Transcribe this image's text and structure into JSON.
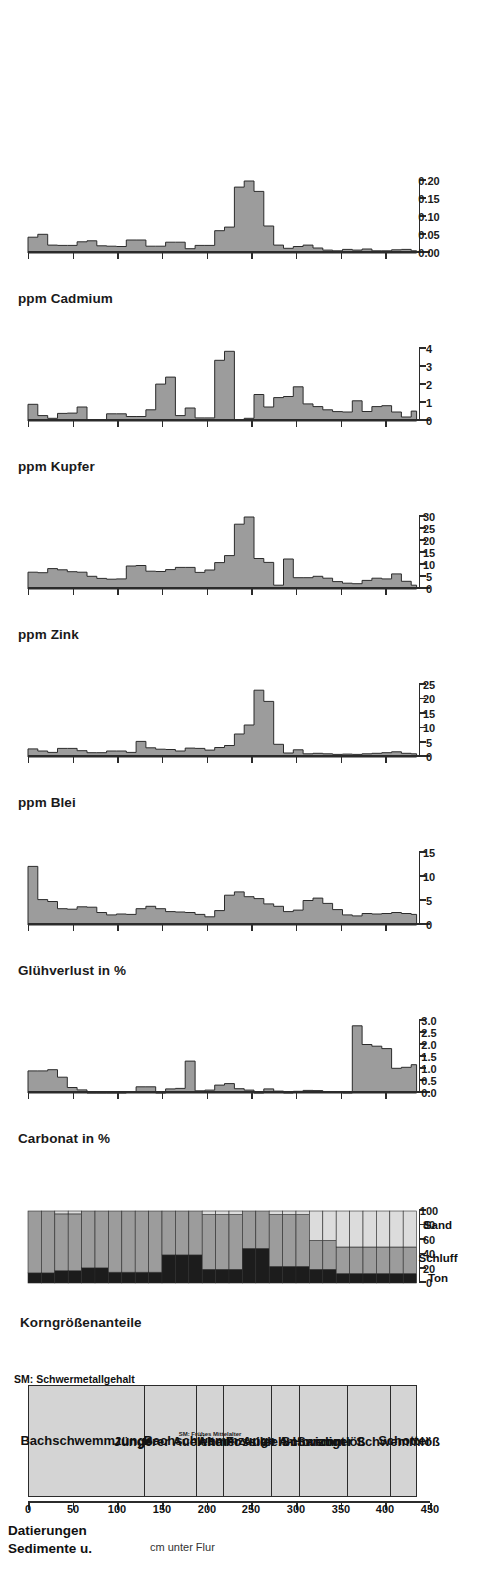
{
  "figure": {
    "orientation": "rotated-90",
    "depth_axis": {
      "label": "cm unter Flur",
      "ticks": [
        0,
        50,
        100,
        150,
        200,
        250,
        300,
        350,
        400,
        450
      ],
      "min": 0,
      "max": 450
    },
    "colors": {
      "bar_fill": "#9c9c9c",
      "bar_stroke": "#2b2b2b",
      "ton": "#1c1c1c",
      "schluff": "#9c9c9c",
      "sand": "#dcdcdc",
      "sediment_fill": "#d4d4d4",
      "axis": "#2b2b2b"
    }
  },
  "sediment_panel": {
    "title_line1": "Sedimente u.",
    "title_line2": "Datierungen",
    "footnote": "SM: Schwermetallgehalt",
    "units": [
      {
        "label": "Bachschwemmzunge",
        "from": 0,
        "to": 130,
        "sub": ""
      },
      {
        "label": "Jüngerer Auelehm",
        "from": 130,
        "to": 188,
        "sub": ""
      },
      {
        "label": "Bachschwemmzunge",
        "from": 188,
        "to": 218,
        "sub": "SM: Frühes Mittelalter"
      },
      {
        "label": "Älterer Auelehm",
        "from": 218,
        "to": 272,
        "sub": ""
      },
      {
        "label": "Fossiler A-Horizont",
        "from": 272,
        "to": 303,
        "sub": ""
      },
      {
        "label": "Schwemmlöß",
        "from": 303,
        "to": 357,
        "sub": ""
      },
      {
        "label": "Sandiger Schwemmlöß",
        "from": 357,
        "to": 405,
        "sub": ""
      },
      {
        "label": "Schotter",
        "from": 405,
        "to": 435,
        "sub": ""
      }
    ]
  },
  "chart_data": [
    {
      "id": "korngroesse",
      "type": "area",
      "title": "Korngrößenanteile",
      "ylabel": "Korngrößenanteile",
      "ylim": [
        0,
        100
      ],
      "yticks": [
        0,
        20,
        40,
        60,
        80,
        100
      ],
      "xlabel": "cm unter Flur",
      "grid": false,
      "legend_position": "right",
      "legend": [
        "Ton",
        "Schluff",
        "Sand"
      ],
      "depth_bins": [
        [
          0,
          15
        ],
        [
          15,
          30
        ],
        [
          30,
          45
        ],
        [
          45,
          60
        ],
        [
          60,
          75
        ],
        [
          75,
          90
        ],
        [
          90,
          105
        ],
        [
          105,
          120
        ],
        [
          120,
          135
        ],
        [
          135,
          150
        ],
        [
          150,
          165
        ],
        [
          165,
          180
        ],
        [
          180,
          195
        ],
        [
          195,
          210
        ],
        [
          210,
          225
        ],
        [
          225,
          240
        ],
        [
          240,
          255
        ],
        [
          255,
          270
        ],
        [
          270,
          285
        ],
        [
          285,
          300
        ],
        [
          300,
          315
        ],
        [
          315,
          330
        ],
        [
          330,
          345
        ],
        [
          345,
          360
        ],
        [
          360,
          375
        ],
        [
          375,
          390
        ],
        [
          390,
          405
        ],
        [
          405,
          420
        ],
        [
          420,
          435
        ]
      ],
      "series": [
        {
          "name": "Ton",
          "values": [
            14,
            14,
            17,
            17,
            21,
            21,
            15,
            15,
            15,
            15,
            39,
            39,
            39,
            19,
            19,
            19,
            48,
            48,
            23,
            23,
            23,
            19,
            19,
            13,
            13,
            13,
            13,
            13,
            13
          ]
        },
        {
          "name": "Schluff",
          "values": [
            86,
            86,
            79,
            79,
            79,
            79,
            85,
            85,
            85,
            85,
            61,
            61,
            61,
            76,
            76,
            76,
            52,
            52,
            72,
            72,
            72,
            40,
            40,
            37,
            37,
            37,
            37,
            37,
            37
          ]
        },
        {
          "name": "Sand",
          "values": [
            0,
            0,
            4,
            4,
            0,
            0,
            0,
            0,
            0,
            0,
            0,
            0,
            0,
            5,
            5,
            5,
            0,
            0,
            5,
            5,
            5,
            41,
            41,
            50,
            50,
            50,
            50,
            50,
            50
          ]
        }
      ]
    },
    {
      "id": "carbonat",
      "type": "area",
      "title": "Carbonat in %",
      "ylabel": "Carbonat in %",
      "ylim": [
        0,
        3.0
      ],
      "yticks": [
        0.0,
        0.5,
        1.0,
        1.5,
        2.0,
        2.5,
        3.0
      ],
      "ytick_labels": [
        "0.0",
        "0.5",
        "1.0",
        "1.5",
        "2.0",
        "2.5",
        "3.0"
      ],
      "xlabel": "cm unter Flur",
      "grid": false,
      "values": [
        0.92,
        0.92,
        0.97,
        0.66,
        0.23,
        0.13,
        0.0,
        0.0,
        0.0,
        0.0,
        0.05,
        0.26,
        0.26,
        0.0,
        0.17,
        0.19,
        1.33,
        0.09,
        0.12,
        0.33,
        0.39,
        0.18,
        0.12,
        0.0,
        0.17,
        0.08,
        0.0,
        0.07,
        0.11,
        0.1,
        0.05,
        0.04,
        0.0,
        2.8,
        2.02,
        1.95,
        1.85,
        1.03,
        1.07,
        1.18
      ],
      "x": [
        0,
        11,
        22,
        33,
        44,
        55,
        66,
        77,
        88,
        99,
        110,
        121,
        132,
        143,
        154,
        165,
        176,
        187,
        198,
        209,
        220,
        231,
        242,
        253,
        264,
        275,
        286,
        297,
        308,
        319,
        330,
        341,
        352,
        363,
        374,
        385,
        396,
        407,
        418,
        429
      ]
    },
    {
      "id": "gluehverlust",
      "type": "area",
      "title": "Glühverlust in %",
      "ylabel": "Glühverlust in %",
      "ylim": [
        0,
        15
      ],
      "yticks": [
        0,
        5,
        10,
        15
      ],
      "xlabel": "cm unter Flur",
      "grid": false,
      "values": [
        12.2,
        5.3,
        4.9,
        3.4,
        3.3,
        3.8,
        3.7,
        2.6,
        2.1,
        2.3,
        2.2,
        3.4,
        3.9,
        3.4,
        2.8,
        2.7,
        2.6,
        2.2,
        1.7,
        3.0,
        6.2,
        6.9,
        5.9,
        5.5,
        4.4,
        3.9,
        2.8,
        3.1,
        5.1,
        5.6,
        4.5,
        3.2,
        2.1,
        1.9,
        2.4,
        2.3,
        2.4,
        2.6,
        2.4,
        2.2
      ],
      "x": [
        0,
        11,
        22,
        33,
        44,
        55,
        66,
        77,
        88,
        99,
        110,
        121,
        132,
        143,
        154,
        165,
        176,
        187,
        198,
        209,
        220,
        231,
        242,
        253,
        264,
        275,
        286,
        297,
        308,
        319,
        330,
        341,
        352,
        363,
        374,
        385,
        396,
        407,
        418,
        429
      ]
    },
    {
      "id": "blei",
      "type": "area",
      "title": "ppm Blei",
      "ylabel": "ppm Blei",
      "ylim": [
        0,
        25
      ],
      "yticks": [
        0,
        5,
        10,
        15,
        20,
        25
      ],
      "xlabel": "cm unter Flur",
      "grid": false,
      "values": [
        2.8,
        2.1,
        1.6,
        3.0,
        3.0,
        2.2,
        1.5,
        1.5,
        2.1,
        2.1,
        1.6,
        5.4,
        3.2,
        2.7,
        2.6,
        2.1,
        3.1,
        3.0,
        2.4,
        3.3,
        4.0,
        8.0,
        11.1,
        23.2,
        19.3,
        4.4,
        1.4,
        2.5,
        1.1,
        1.3,
        1.1,
        0.9,
        1.0,
        0.9,
        1.1,
        1.3,
        1.5,
        1.8,
        1.3,
        1.1
      ],
      "x": [
        0,
        11,
        22,
        33,
        44,
        55,
        66,
        77,
        88,
        99,
        110,
        121,
        132,
        143,
        154,
        165,
        176,
        187,
        198,
        209,
        220,
        231,
        242,
        253,
        264,
        275,
        286,
        297,
        308,
        319,
        330,
        341,
        352,
        363,
        374,
        385,
        396,
        407,
        418,
        429
      ]
    },
    {
      "id": "zink",
      "type": "area",
      "title": "ppm Zink",
      "ylabel": "ppm Zink",
      "ylim": [
        0,
        30
      ],
      "yticks": [
        0,
        5,
        10,
        15,
        20,
        25,
        30
      ],
      "xlabel": "cm unter Flur",
      "grid": false,
      "values": [
        7.0,
        6.8,
        8.5,
        8.0,
        7.2,
        7.0,
        5.3,
        4.4,
        4.1,
        4.2,
        9.6,
        9.8,
        7.4,
        7.3,
        8.1,
        9.0,
        9.0,
        6.9,
        7.9,
        11.0,
        13.9,
        27.0,
        30.0,
        12.7,
        11.1,
        1.6,
        12.5,
        4.7,
        4.7,
        5.3,
        4.5,
        3.1,
        2.4,
        2.2,
        3.6,
        4.5,
        4.2,
        6.3,
        3.2,
        1.6
      ],
      "x": [
        0,
        11,
        22,
        33,
        44,
        55,
        66,
        77,
        88,
        99,
        110,
        121,
        132,
        143,
        154,
        165,
        176,
        187,
        198,
        209,
        220,
        231,
        242,
        253,
        264,
        275,
        286,
        297,
        308,
        319,
        330,
        341,
        352,
        363,
        374,
        385,
        396,
        407,
        418,
        429
      ]
    },
    {
      "id": "kupfer",
      "type": "area",
      "title": "ppm Kupfer",
      "ylabel": "ppm Kupfer",
      "ylim": [
        0,
        4
      ],
      "yticks": [
        0,
        1,
        2,
        3,
        4
      ],
      "xlabel": "cm unter Flur",
      "grid": false,
      "values": [
        0.93,
        0.3,
        0.15,
        0.42,
        0.44,
        0.78,
        0.06,
        0.05,
        0.4,
        0.4,
        0.25,
        0.25,
        0.62,
        2.05,
        2.44,
        0.3,
        0.72,
        0.17,
        0.17,
        3.37,
        3.87,
        0.08,
        0.15,
        1.47,
        0.78,
        1.3,
        1.36,
        1.9,
        0.95,
        0.8,
        0.62,
        0.52,
        0.5,
        1.12,
        0.53,
        0.8,
        0.85,
        0.5,
        0.22,
        0.55
      ],
      "x": [
        0,
        11,
        22,
        33,
        44,
        55,
        66,
        77,
        88,
        99,
        110,
        121,
        132,
        143,
        154,
        165,
        176,
        187,
        198,
        209,
        220,
        231,
        242,
        253,
        264,
        275,
        286,
        297,
        308,
        319,
        330,
        341,
        352,
        363,
        374,
        385,
        396,
        407,
        418,
        429
      ]
    },
    {
      "id": "cadmium",
      "type": "area",
      "title": "ppm Cadmium",
      "ylabel": "ppm Cadmium",
      "ylim": [
        0,
        0.2
      ],
      "yticks": [
        0.0,
        0.05,
        0.1,
        0.15,
        0.2
      ],
      "ytick_labels": [
        "0.00",
        "0.05",
        "0.10",
        "0.15",
        "0.20"
      ],
      "xlabel": "cm unter Flur",
      "grid": false,
      "values": [
        0.044,
        0.052,
        0.022,
        0.021,
        0.021,
        0.031,
        0.034,
        0.02,
        0.019,
        0.018,
        0.036,
        0.036,
        0.019,
        0.019,
        0.03,
        0.03,
        0.012,
        0.021,
        0.021,
        0.062,
        0.072,
        0.183,
        0.2,
        0.171,
        0.075,
        0.022,
        0.013,
        0.018,
        0.022,
        0.014,
        0.008,
        0.006,
        0.01,
        0.008,
        0.011,
        0.006,
        0.006,
        0.009,
        0.01,
        0.006
      ],
      "x": [
        0,
        11,
        22,
        33,
        44,
        55,
        66,
        77,
        88,
        99,
        110,
        121,
        132,
        143,
        154,
        165,
        176,
        187,
        198,
        209,
        220,
        231,
        242,
        253,
        264,
        275,
        286,
        297,
        308,
        319,
        330,
        341,
        352,
        363,
        374,
        385,
        396,
        407,
        418,
        429
      ]
    }
  ]
}
